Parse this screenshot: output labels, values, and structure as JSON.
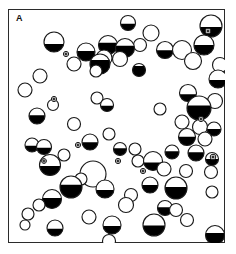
{
  "figure": {
    "panel_label": "A",
    "type": "spatial-distribution-diagram",
    "colors": {
      "outline": "#1a1a1a",
      "fill_dark": "#000000",
      "fill_light": "#ffffff",
      "frame": "#2b2b2b",
      "background": "#ffffff"
    },
    "frame": {
      "x": 0,
      "y": 0,
      "width": 217,
      "height": 234,
      "stroke_width": 1.4
    },
    "marker_legend": {
      "circle": "partially-filled circle (bottom sector shaded black)",
      "crossed_circle": "small circle with central dot/cross"
    }
  },
  "chart_data": {
    "type": "scatter",
    "title": "A",
    "xlabel": "",
    "ylabel": "",
    "xlim": [
      0,
      217
    ],
    "ylim": [
      0,
      234
    ],
    "grid": false,
    "legend": "none",
    "encoding": {
      "x": "horizontal position (px within frame)",
      "y": "vertical position (px within frame)",
      "r": "object radius (px)",
      "fill": "fraction of circle filled black from the bottom (0 = open, 1 = solid)"
    },
    "series": [
      {
        "name": "circles",
        "points": [
          {
            "x": 120,
            "y": 14,
            "r": 7.5,
            "fill": 0.45
          },
          {
            "x": 203,
            "y": 17,
            "r": 11.0,
            "fill": 0.45
          },
          {
            "x": 143,
            "y": 24,
            "r": 8.0,
            "fill": 0.0
          },
          {
            "x": 132,
            "y": 36,
            "r": 6.5,
            "fill": 0.0
          },
          {
            "x": 46,
            "y": 33,
            "r": 10.0,
            "fill": 0.4
          },
          {
            "x": 196,
            "y": 36,
            "r": 10.0,
            "fill": 0.5
          },
          {
            "x": 100,
            "y": 36,
            "r": 9.5,
            "fill": 0.62
          },
          {
            "x": 117,
            "y": 39,
            "r": 9.5,
            "fill": 0.62
          },
          {
            "x": 78,
            "y": 43,
            "r": 9.0,
            "fill": 0.55
          },
          {
            "x": 96,
            "y": 49,
            "r": 8.0,
            "fill": 0.0
          },
          {
            "x": 157,
            "y": 41,
            "r": 8.5,
            "fill": 0.48
          },
          {
            "x": 174,
            "y": 41,
            "r": 9.5,
            "fill": 0.0
          },
          {
            "x": 92,
            "y": 55,
            "r": 10.0,
            "fill": 0.7
          },
          {
            "x": 112,
            "y": 50,
            "r": 7.5,
            "fill": 0.0
          },
          {
            "x": 66,
            "y": 55,
            "r": 7.0,
            "fill": 0.0
          },
          {
            "x": 185,
            "y": 52,
            "r": 8.5,
            "fill": 0.0
          },
          {
            "x": 212,
            "y": 56,
            "r": 7.5,
            "fill": 0.0
          },
          {
            "x": 131,
            "y": 61,
            "r": 6.5,
            "fill": 0.8
          },
          {
            "x": 210,
            "y": 70,
            "r": 9.0,
            "fill": 0.45
          },
          {
            "x": 32,
            "y": 67,
            "r": 7.0,
            "fill": 0.0
          },
          {
            "x": 88,
            "y": 62,
            "r": 6.0,
            "fill": 0.0
          },
          {
            "x": 17,
            "y": 81,
            "r": 7.0,
            "fill": 0.0
          },
          {
            "x": 180,
            "y": 84,
            "r": 8.5,
            "fill": 0.42
          },
          {
            "x": 89,
            "y": 89,
            "r": 6.0,
            "fill": 0.0
          },
          {
            "x": 207,
            "y": 92,
            "r": 7.5,
            "fill": 0.0
          },
          {
            "x": 45,
            "y": 96,
            "r": 5.5,
            "fill": 0.0
          },
          {
            "x": 99,
            "y": 96,
            "r": 6.5,
            "fill": 0.45
          },
          {
            "x": 191,
            "y": 99,
            "r": 12.0,
            "fill": 0.6
          },
          {
            "x": 152,
            "y": 100,
            "r": 6.0,
            "fill": 0.0
          },
          {
            "x": 29,
            "y": 107,
            "r": 8.0,
            "fill": 0.55
          },
          {
            "x": 174,
            "y": 113,
            "r": 7.0,
            "fill": 0.0
          },
          {
            "x": 192,
            "y": 118,
            "r": 7.5,
            "fill": 0.0
          },
          {
            "x": 206,
            "y": 120,
            "r": 7.0,
            "fill": 0.5
          },
          {
            "x": 66,
            "y": 115,
            "r": 6.5,
            "fill": 0.0
          },
          {
            "x": 179,
            "y": 128,
            "r": 8.5,
            "fill": 0.52
          },
          {
            "x": 101,
            "y": 125,
            "r": 6.0,
            "fill": 0.0
          },
          {
            "x": 197,
            "y": 130,
            "r": 7.0,
            "fill": 0.0
          },
          {
            "x": 82,
            "y": 133,
            "r": 8.0,
            "fill": 0.48
          },
          {
            "x": 24,
            "y": 136,
            "r": 7.0,
            "fill": 0.45
          },
          {
            "x": 36,
            "y": 138,
            "r": 7.5,
            "fill": 0.45
          },
          {
            "x": 112,
            "y": 140,
            "r": 6.5,
            "fill": 0.55
          },
          {
            "x": 127,
            "y": 140,
            "r": 6.0,
            "fill": 0.0
          },
          {
            "x": 164,
            "y": 143,
            "r": 7.0,
            "fill": 0.55
          },
          {
            "x": 188,
            "y": 144,
            "r": 8.0,
            "fill": 0.55
          },
          {
            "x": 204,
            "y": 150,
            "r": 6.5,
            "fill": 0.5
          },
          {
            "x": 56,
            "y": 146,
            "r": 6.0,
            "fill": 0.0
          },
          {
            "x": 130,
            "y": 152,
            "r": 6.0,
            "fill": 0.0
          },
          {
            "x": 42,
            "y": 156,
            "r": 10.5,
            "fill": 0.45
          },
          {
            "x": 145,
            "y": 152,
            "r": 9.5,
            "fill": 0.42
          },
          {
            "x": 156,
            "y": 160,
            "r": 7.0,
            "fill": 0.0
          },
          {
            "x": 178,
            "y": 162,
            "r": 6.5,
            "fill": 0.0
          },
          {
            "x": 85,
            "y": 165,
            "r": 13.0,
            "fill": 0.0
          },
          {
            "x": 203,
            "y": 163,
            "r": 6.5,
            "fill": 0.0
          },
          {
            "x": 73,
            "y": 170,
            "r": 6.0,
            "fill": 0.0
          },
          {
            "x": 63,
            "y": 178,
            "r": 11.0,
            "fill": 0.6
          },
          {
            "x": 97,
            "y": 180,
            "r": 9.0,
            "fill": 0.45
          },
          {
            "x": 142,
            "y": 176,
            "r": 8.0,
            "fill": 0.5
          },
          {
            "x": 168,
            "y": 179,
            "r": 11.0,
            "fill": 0.55
          },
          {
            "x": 44,
            "y": 190,
            "r": 9.5,
            "fill": 0.55
          },
          {
            "x": 123,
            "y": 186,
            "r": 6.5,
            "fill": 0.0
          },
          {
            "x": 204,
            "y": 183,
            "r": 6.0,
            "fill": 0.0
          },
          {
            "x": 118,
            "y": 196,
            "r": 7.5,
            "fill": 0.0
          },
          {
            "x": 31,
            "y": 196,
            "r": 6.0,
            "fill": 0.0
          },
          {
            "x": 157,
            "y": 199,
            "r": 7.5,
            "fill": 0.55
          },
          {
            "x": 168,
            "y": 201,
            "r": 6.5,
            "fill": 0.0
          },
          {
            "x": 20,
            "y": 205,
            "r": 6.0,
            "fill": 0.0
          },
          {
            "x": 81,
            "y": 208,
            "r": 7.0,
            "fill": 0.0
          },
          {
            "x": 17,
            "y": 216,
            "r": 5.0,
            "fill": 0.0
          },
          {
            "x": 104,
            "y": 216,
            "r": 9.0,
            "fill": 0.45
          },
          {
            "x": 179,
            "y": 211,
            "r": 6.5,
            "fill": 0.0
          },
          {
            "x": 47,
            "y": 219,
            "r": 8.0,
            "fill": 0.45
          },
          {
            "x": 146,
            "y": 216,
            "r": 11.0,
            "fill": 0.48
          },
          {
            "x": 207,
            "y": 226,
            "r": 9.5,
            "fill": 0.6
          },
          {
            "x": 101,
            "y": 232,
            "r": 6.5,
            "fill": 0.0
          }
        ]
      },
      {
        "name": "crossed-circles",
        "points": [
          {
            "x": 58,
            "y": 45,
            "r": 2.6
          },
          {
            "x": 200,
            "y": 22,
            "r": 2.8
          },
          {
            "x": 46,
            "y": 90,
            "r": 2.6
          },
          {
            "x": 193,
            "y": 110,
            "r": 2.6
          },
          {
            "x": 70,
            "y": 136,
            "r": 2.6
          },
          {
            "x": 205,
            "y": 148,
            "r": 2.8
          },
          {
            "x": 36,
            "y": 152,
            "r": 2.4
          },
          {
            "x": 110,
            "y": 152,
            "r": 2.6
          },
          {
            "x": 135,
            "y": 162,
            "r": 2.6
          }
        ]
      }
    ]
  }
}
